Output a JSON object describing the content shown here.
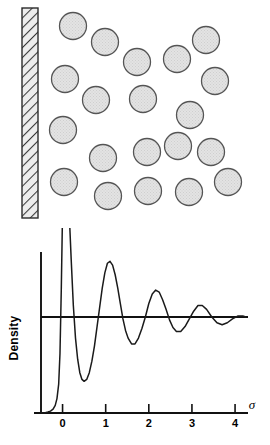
{
  "figure": {
    "name": "hard-sphere-fluid-density-profile-at-a-wall",
    "panels": [
      "particle-schematic",
      "density-profile-plot"
    ]
  },
  "particle_panel": {
    "wall": {
      "label": "hatched-wall",
      "x": 22,
      "y": 8,
      "width": 16,
      "height": 210,
      "fill": "#e8e8e8",
      "stroke": "#333333",
      "hatch_angle_deg": 45
    },
    "particle": {
      "radius": 13.5,
      "fill": "#dcdcdc",
      "stroke": "#555555"
    },
    "particles": [
      {
        "cx": 73,
        "cy": 26
      },
      {
        "cx": 105,
        "cy": 42
      },
      {
        "cx": 137,
        "cy": 62
      },
      {
        "cx": 177,
        "cy": 59
      },
      {
        "cx": 206,
        "cy": 40
      },
      {
        "cx": 65,
        "cy": 79
      },
      {
        "cx": 96,
        "cy": 100
      },
      {
        "cx": 143,
        "cy": 99
      },
      {
        "cx": 215,
        "cy": 81
      },
      {
        "cx": 190,
        "cy": 115
      },
      {
        "cx": 63,
        "cy": 130
      },
      {
        "cx": 147,
        "cy": 152
      },
      {
        "cx": 178,
        "cy": 146
      },
      {
        "cx": 211,
        "cy": 152
      },
      {
        "cx": 103,
        "cy": 158
      },
      {
        "cx": 64,
        "cy": 182
      },
      {
        "cx": 108,
        "cy": 196
      },
      {
        "cx": 148,
        "cy": 191
      },
      {
        "cx": 189,
        "cy": 192
      },
      {
        "cx": 228,
        "cy": 182
      }
    ]
  },
  "chart_data": {
    "type": "line",
    "title": "",
    "xlabel": "σ",
    "ylabel": "Density",
    "xticks": [
      0,
      1,
      2,
      3,
      4
    ],
    "xtick_labels": [
      "0",
      "1",
      "2",
      "3",
      "4"
    ],
    "yticks": [],
    "ytick_labels": [],
    "xlim": [
      -0.5,
      4.3
    ],
    "ylim": [
      0,
      3.0
    ],
    "grid": false,
    "legend": false,
    "baseline_y": 1.0,
    "baseline_label": "bulk-density-reference-line",
    "series": [
      {
        "name": "density-profile",
        "stroke": "#1a1a1a",
        "x": [
          -0.5,
          -0.42,
          -0.34,
          -0.28,
          -0.22,
          -0.17,
          -0.13,
          -0.09,
          -0.06,
          -0.03,
          0.0,
          0.02,
          0.04,
          0.06,
          0.09,
          0.12,
          0.16,
          0.2,
          0.25,
          0.3,
          0.35,
          0.4,
          0.45,
          0.5,
          0.56,
          0.62,
          0.68,
          0.74,
          0.8,
          0.86,
          0.92,
          0.98,
          1.04,
          1.1,
          1.16,
          1.22,
          1.28,
          1.34,
          1.4,
          1.46,
          1.52,
          1.6,
          1.68,
          1.76,
          1.84,
          1.92,
          2.0,
          2.08,
          2.16,
          2.24,
          2.32,
          2.4,
          2.48,
          2.56,
          2.64,
          2.74,
          2.84,
          2.94,
          3.04,
          3.14,
          3.24,
          3.34,
          3.46,
          3.58,
          3.7,
          3.82,
          3.94,
          4.06,
          4.18,
          4.25
        ],
        "y": [
          0.0,
          0.0,
          0.01,
          0.02,
          0.04,
          0.08,
          0.15,
          0.3,
          0.62,
          1.28,
          2.1,
          2.52,
          2.74,
          2.8,
          2.7,
          2.44,
          2.02,
          1.6,
          1.12,
          0.78,
          0.56,
          0.42,
          0.35,
          0.33,
          0.35,
          0.42,
          0.54,
          0.7,
          0.9,
          1.1,
          1.3,
          1.46,
          1.56,
          1.58,
          1.54,
          1.44,
          1.3,
          1.14,
          0.98,
          0.86,
          0.78,
          0.72,
          0.72,
          0.78,
          0.88,
          1.0,
          1.14,
          1.24,
          1.28,
          1.26,
          1.18,
          1.08,
          0.97,
          0.89,
          0.85,
          0.85,
          0.9,
          0.98,
          1.06,
          1.12,
          1.12,
          1.08,
          1.0,
          0.94,
          0.92,
          0.94,
          0.98,
          1.01,
          1.01,
          1.0
        ]
      }
    ],
    "annotations": [
      {
        "text": "σ",
        "role": "x-axis-symbol"
      },
      {
        "text": "Density",
        "role": "y-axis-title"
      }
    ]
  }
}
